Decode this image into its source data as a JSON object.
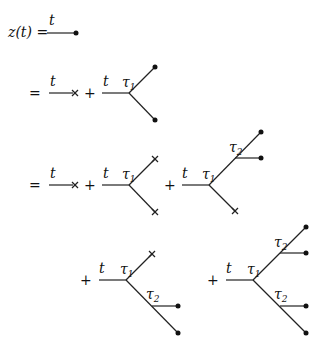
{
  "equation": {
    "lhs": "z(t) =",
    "equals": "=",
    "plus": "+",
    "time_label": "t",
    "tau_symbol": "τ",
    "tau1_sub": "1",
    "tau2_sub": "2"
  },
  "legend": {
    "dot": "filled-node",
    "cross": "terminal-cross"
  }
}
